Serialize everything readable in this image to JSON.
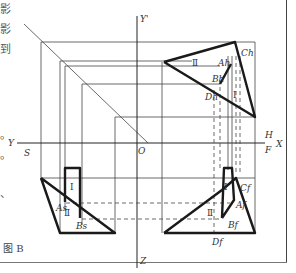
{
  "figure": {
    "caption": "图 B",
    "side_text": [
      "影",
      "影",
      "到",
      "。",
      "。",
      "、"
    ]
  },
  "axes": {
    "y_prime": "Y'",
    "y_left": "Y",
    "s": "S",
    "o": "O",
    "h": "H",
    "f": "F",
    "x": "X",
    "z": "Z"
  },
  "labels": {
    "c_h": "Ch",
    "a_h": "Ah",
    "b_h": "Bh",
    "d_h": "Dh",
    "c_f": "Cf",
    "a_f": "Af",
    "b_f": "Bf",
    "d_f": "Df",
    "a_s": "As",
    "b_s": "Bs",
    "region_1": "Ⅰ",
    "region_2": "Ⅱ"
  },
  "colors": {
    "line": "#333333",
    "thick": "#1a1a1a",
    "background": "#ffffff"
  }
}
